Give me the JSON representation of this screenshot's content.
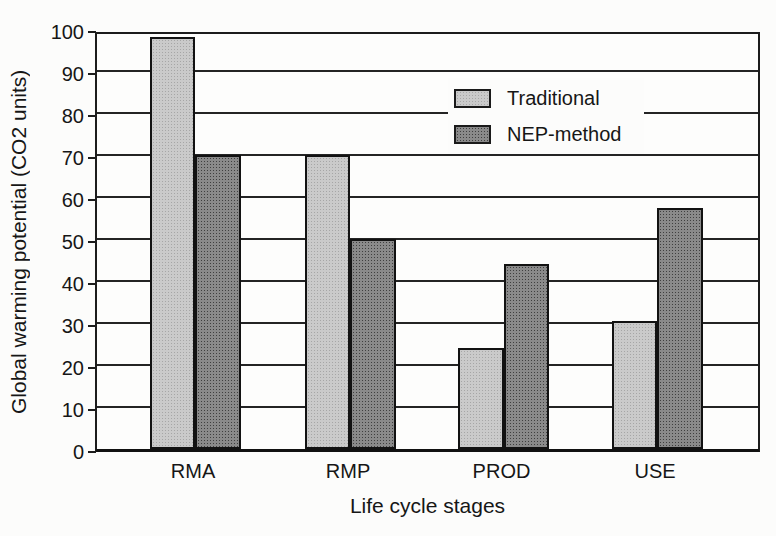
{
  "chart_data": {
    "type": "bar",
    "title": "",
    "xlabel": "Life cycle stages",
    "ylabel": "Global warming potential (CO2 units)",
    "categories": [
      "RMA",
      "RMP",
      "PROD",
      "USE"
    ],
    "series": [
      {
        "name": "Traditional",
        "fill": "#cacaca",
        "dot": "#a6a6a6",
        "values": [
          98,
          70,
          24,
          30.5
        ]
      },
      {
        "name": "NEP-method",
        "fill": "#8a8a8a",
        "dot": "#3f3f3f",
        "values": [
          70,
          50,
          44,
          57.5
        ]
      }
    ],
    "ylim": [
      0,
      100
    ],
    "yticks": [
      0,
      10,
      20,
      30,
      40,
      50,
      60,
      70,
      80,
      90,
      100
    ],
    "grid": "horizontal",
    "legend_position": "inside-upper-right",
    "axis_color": "#1c1c1c",
    "background": "#fcfcfb"
  }
}
